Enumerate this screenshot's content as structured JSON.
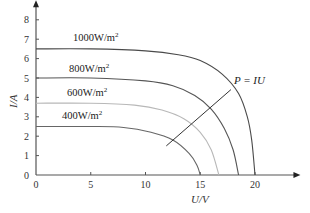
{
  "chart_data": {
    "type": "line",
    "title": "",
    "xlabel": "U/V",
    "ylabel": "I/A",
    "xlim": [
      0,
      24
    ],
    "ylim": [
      0,
      8.5
    ],
    "x_ticks": [
      "0",
      "5",
      "10",
      "15",
      "20"
    ],
    "y_ticks": [
      "0",
      "1",
      "2",
      "3",
      "4",
      "5",
      "6",
      "7",
      "8"
    ],
    "grid": false,
    "legend": "inline labels",
    "series": [
      {
        "name": "1000W/m²",
        "label": "1000W/m",
        "sup": "2",
        "isc": 6.5,
        "voc": 20.0,
        "color": "#4a4a4a",
        "points": [
          [
            0,
            6.5
          ],
          [
            5,
            6.5
          ],
          [
            10,
            6.4
          ],
          [
            13,
            6.2
          ],
          [
            15,
            5.9
          ],
          [
            17,
            5.2
          ],
          [
            18.5,
            4.2
          ],
          [
            19.3,
            3.0
          ],
          [
            19.7,
            1.8
          ],
          [
            20,
            0
          ]
        ]
      },
      {
        "name": "800W/m²",
        "label": "800W/m",
        "sup": "2",
        "isc": 5.0,
        "voc": 18.5,
        "color": "#555555",
        "points": [
          [
            0,
            5.0
          ],
          [
            5,
            5.0
          ],
          [
            10,
            4.85
          ],
          [
            12.5,
            4.6
          ],
          [
            14.5,
            4.1
          ],
          [
            16,
            3.4
          ],
          [
            17.2,
            2.4
          ],
          [
            18,
            1.3
          ],
          [
            18.5,
            0
          ]
        ]
      },
      {
        "name": "600W/m²",
        "label": "600W/m",
        "sup": "2",
        "isc": 3.7,
        "voc": 16.7,
        "color": "#b8b8b8",
        "points": [
          [
            0,
            3.7
          ],
          [
            5,
            3.7
          ],
          [
            9,
            3.6
          ],
          [
            11.5,
            3.35
          ],
          [
            13.5,
            2.9
          ],
          [
            15,
            2.2
          ],
          [
            16,
            1.3
          ],
          [
            16.7,
            0
          ]
        ]
      },
      {
        "name": "400W/m²",
        "label": "400W/m",
        "sup": "2",
        "isc": 2.5,
        "voc": 15.0,
        "color": "#666666",
        "points": [
          [
            0,
            2.5
          ],
          [
            5,
            2.5
          ],
          [
            8,
            2.45
          ],
          [
            10.5,
            2.2
          ],
          [
            12.5,
            1.8
          ],
          [
            14,
            1.1
          ],
          [
            14.7,
            0.5
          ],
          [
            15,
            0
          ]
        ]
      }
    ],
    "annotations": [
      {
        "text": "P = IU",
        "line_from": [
          11.9,
          1.5
        ],
        "line_to": [
          17.8,
          4.4
        ]
      }
    ]
  },
  "labels": {
    "xlabel": "U/V",
    "ylabel": "I/A",
    "annotation": "P = IU"
  }
}
